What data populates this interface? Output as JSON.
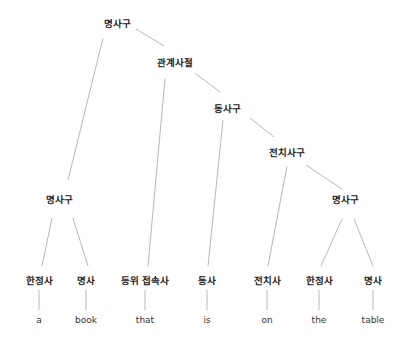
{
  "diagram": {
    "type": "parse-tree",
    "nodes": {
      "np_root": "명사구",
      "rel_clause": "관계사절",
      "vp": "동사구",
      "pp": "전치사구",
      "np_right": "명사구",
      "np_left": "명사구"
    },
    "pos_tags": [
      "한정사",
      "명사",
      "등위 접속사",
      "동사",
      "전치사",
      "한정사",
      "명사"
    ],
    "words": [
      "a",
      "book",
      "that",
      "is",
      "on",
      "the",
      "table"
    ],
    "edges": [
      [
        "명사구(root)",
        "명사구(left)"
      ],
      [
        "명사구(root)",
        "관계사절"
      ],
      [
        "관계사절",
        "등위 접속사"
      ],
      [
        "관계사절",
        "동사구"
      ],
      [
        "동사구",
        "동사"
      ],
      [
        "동사구",
        "전치사구"
      ],
      [
        "전치사구",
        "전치사"
      ],
      [
        "전치사구",
        "명사구(right)"
      ],
      [
        "명사구(left)",
        "한정사"
      ],
      [
        "명사구(left)",
        "명사"
      ],
      [
        "명사구(right)",
        "한정사"
      ],
      [
        "명사구(right)",
        "명사"
      ]
    ],
    "colors": {
      "edge": "#b8b8b8",
      "text": "#222222"
    }
  }
}
